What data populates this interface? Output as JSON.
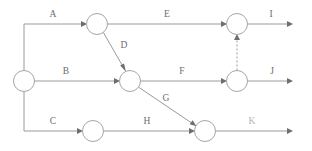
{
  "diagram": {
    "type": "directed-graph",
    "canvas": {
      "width": 312,
      "height": 151
    },
    "colors": {
      "background": "#ffffff",
      "edge": "#9a9a9a",
      "node_stroke": "#a6a6a6",
      "node_fill": "#ffffff",
      "arrow": "#6e6e6e",
      "label": "#6d6d6d",
      "label_faint": "#b4b4b4"
    },
    "nodes": [
      {
        "id": "n-start",
        "name": "start-node",
        "cx": 24,
        "cy": 81,
        "r": 10.5
      },
      {
        "id": "n-a",
        "name": "node-a-end",
        "cx": 97,
        "cy": 24,
        "r": 10.5
      },
      {
        "id": "n-b",
        "name": "node-b-end",
        "cx": 130,
        "cy": 81,
        "r": 10.5
      },
      {
        "id": "n-c",
        "name": "node-c-end",
        "cx": 93,
        "cy": 131,
        "r": 10.5
      },
      {
        "id": "n-e",
        "name": "node-e-end",
        "cx": 237,
        "cy": 24,
        "r": 10.5
      },
      {
        "id": "n-f",
        "name": "node-f-end",
        "cx": 237,
        "cy": 81,
        "r": 10.5
      },
      {
        "id": "n-h",
        "name": "node-h-end",
        "cx": 205,
        "cy": 131,
        "r": 10.5
      }
    ],
    "edges": [
      {
        "id": "e-a",
        "label": "A",
        "from": "start",
        "to": "n-a",
        "style": "solid",
        "label_x": 53,
        "label_y": 17
      },
      {
        "id": "e-b",
        "label": "B",
        "from": "start",
        "to": "n-b",
        "style": "solid",
        "label_x": 66,
        "label_y": 74
      },
      {
        "id": "e-c",
        "label": "C",
        "from": "start",
        "to": "n-c",
        "style": "solid",
        "label_x": 53,
        "label_y": 124
      },
      {
        "id": "e-d",
        "label": "D",
        "from": "n-a",
        "to": "n-b",
        "style": "solid",
        "label_x": 124,
        "label_y": 48
      },
      {
        "id": "e-e",
        "label": "E",
        "from": "n-a",
        "to": "n-e",
        "style": "solid",
        "label_x": 167,
        "label_y": 17
      },
      {
        "id": "e-f",
        "label": "F",
        "from": "n-b",
        "to": "n-f",
        "style": "solid",
        "label_x": 182,
        "label_y": 74
      },
      {
        "id": "e-g",
        "label": "G",
        "from": "n-b",
        "to": "n-h",
        "style": "solid",
        "label_x": 166,
        "label_y": 101
      },
      {
        "id": "e-h",
        "label": "H",
        "from": "n-c",
        "to": "n-h",
        "style": "solid",
        "label_x": 147,
        "label_y": 124
      },
      {
        "id": "e-i",
        "label": "I",
        "from": "n-e",
        "to": "sink-top",
        "style": "solid",
        "label_x": 271,
        "label_y": 17
      },
      {
        "id": "e-j",
        "label": "J",
        "from": "n-f",
        "to": "sink-mid",
        "style": "solid",
        "label_x": 272,
        "label_y": 74
      },
      {
        "id": "e-k",
        "label": "K",
        "from": "n-h",
        "to": "sink-bottom",
        "style": "solid",
        "label_x": 252,
        "label_y": 124,
        "faint": true
      },
      {
        "id": "e-dummy",
        "label": "",
        "from": "n-f",
        "to": "n-e",
        "style": "dashed"
      }
    ],
    "labels": [
      "A",
      "B",
      "C",
      "D",
      "E",
      "F",
      "G",
      "H",
      "I",
      "J",
      "K"
    ]
  }
}
